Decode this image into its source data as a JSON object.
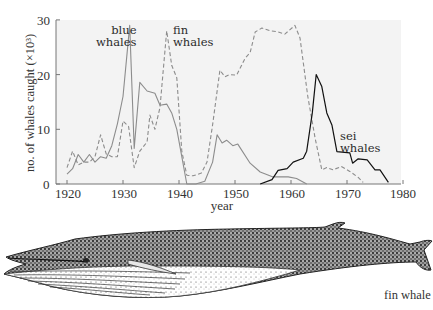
{
  "chart_data": {
    "type": "line",
    "title": "",
    "xlabel": "year",
    "ylabel": "no. of whales caught (×10³)",
    "xlim": [
      1920,
      1980
    ],
    "ylim": [
      0,
      30
    ],
    "xticks": [
      "1920",
      "1930",
      "1940",
      "1950",
      "1960",
      "1970",
      "1980"
    ],
    "yticks": [
      "0",
      "10",
      "20",
      "30"
    ],
    "grid": false,
    "legend": "inline labels",
    "series": [
      {
        "name": "blue whales",
        "style": "solid",
        "color": "#8c8c8c",
        "label_lines": [
          "blue",
          "whales"
        ],
        "x": [
          1920,
          1921,
          1922,
          1923,
          1924,
          1925,
          1926,
          1927,
          1928,
          1929,
          1930,
          1931.2,
          1932,
          1933,
          1934.3,
          1935.7,
          1936.6,
          1937.8,
          1938.7,
          1939.6,
          1940.5,
          1941.4,
          1943,
          1944.6,
          1946,
          1946.8,
          1947.7,
          1948.5,
          1949.6,
          1950.5,
          1952.7,
          1954.5,
          1956.8,
          1959.5,
          1961,
          1962.8
        ],
        "y": [
          1.8,
          2.8,
          5.4,
          4.0,
          5.4,
          4.0,
          5.0,
          4.7,
          7.0,
          11.0,
          16.0,
          29.0,
          6.5,
          18.6,
          17.0,
          16.6,
          14.4,
          14.6,
          13.0,
          10.0,
          5.0,
          0.0,
          0.0,
          0.5,
          4.0,
          9.0,
          7.5,
          8.0,
          7.0,
          7.3,
          3.8,
          2.2,
          1.3,
          1.3,
          1.0,
          0.0
        ]
      },
      {
        "name": "fin whales",
        "style": "dashed",
        "color": "#8c8c8c",
        "label_lines": [
          "fin",
          "whales"
        ],
        "x": [
          1920,
          1921,
          1922,
          1923,
          1924,
          1925,
          1926,
          1927,
          1928,
          1929,
          1930,
          1931,
          1932,
          1933,
          1934.3,
          1934.8,
          1935.7,
          1936.6,
          1937.8,
          1938.7,
          1939.6,
          1940.5,
          1941.4,
          1942.5,
          1944,
          1945,
          1946,
          1947.3,
          1948.2,
          1949,
          1950.3,
          1951.8,
          1952.7,
          1953.6,
          1954.8,
          1956.3,
          1957.7,
          1958.9,
          1960.7,
          1961.6,
          1963,
          1964.3,
          1965.5,
          1966.4,
          1967.5,
          1969,
          1970.5,
          1972,
          1972.9
        ],
        "y": [
          3.0,
          6.0,
          3.5,
          4.0,
          4.0,
          5.0,
          9.0,
          5.5,
          5.0,
          5.0,
          11.5,
          10.5,
          3.0,
          6.0,
          7.7,
          12.6,
          10.0,
          14.0,
          28.0,
          21.7,
          19.4,
          6.0,
          1.6,
          1.5,
          2.0,
          4.0,
          10.8,
          20.8,
          19.6,
          20.0,
          19.9,
          23.0,
          24.0,
          27.8,
          28.5,
          28.0,
          27.8,
          27.4,
          29.0,
          26.7,
          16.0,
          8.4,
          2.6,
          3.0,
          2.6,
          3.2,
          2.3,
          1.2,
          0.3
        ]
      },
      {
        "name": "sei whales",
        "style": "solid",
        "color": "#111111",
        "label_lines": [
          "sei",
          "whales"
        ],
        "x": [
          1954.5,
          1956.6,
          1957.7,
          1959.3,
          1960.4,
          1962.2,
          1962.8,
          1963.8,
          1964.5,
          1965.5,
          1966.4,
          1967.3,
          1968.2,
          1970.5,
          1971,
          1972,
          1973.6,
          1975,
          1975.9,
          1977.4
        ],
        "y": [
          0.0,
          0.8,
          2.5,
          2.8,
          4.0,
          4.7,
          6.0,
          13.0,
          20.0,
          17.8,
          13.0,
          10.8,
          5.9,
          5.7,
          3.8,
          4.6,
          4.4,
          2.6,
          2.6,
          0.3
        ]
      }
    ]
  },
  "labels": {
    "blue_1": "blue",
    "blue_2": "whales",
    "fin_1": "fin",
    "fin_2": "whales",
    "sei_1": "sei",
    "sei_2": "whales",
    "y_axis": "no. of whales caught (×10³)",
    "x_axis": "year",
    "y_ticks": [
      "0",
      "10",
      "20",
      "30"
    ],
    "x_ticks": [
      "1920",
      "1930",
      "1940",
      "1950",
      "1960",
      "1970",
      "1980"
    ]
  },
  "illustration": {
    "subject": "fin-whale",
    "caption": "fin whale"
  },
  "colors": {
    "plot_bg": "#f3f3f3",
    "axis": "#777777",
    "gray_line": "#8c8c8c",
    "black_line": "#111111"
  }
}
